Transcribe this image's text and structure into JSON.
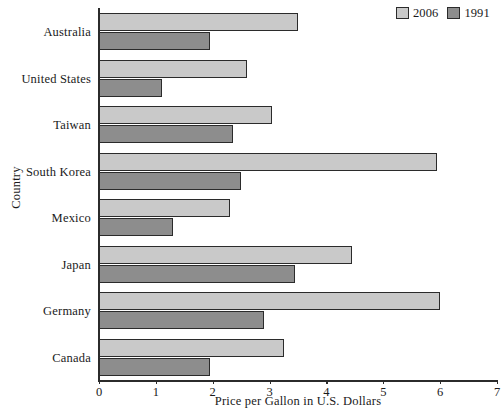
{
  "chart_data": {
    "type": "bar",
    "orientation": "horizontal",
    "title": "",
    "xlabel": "Price per Gallon in U.S. Dollars",
    "ylabel": "Country",
    "xlim": [
      0,
      7
    ],
    "xticks": [
      "0",
      "1",
      "2",
      "3",
      "4",
      "5",
      "6",
      "7"
    ],
    "grid": false,
    "legend_position": "top-right",
    "categories": [
      "Australia",
      "United States",
      "Taiwan",
      "South Korea",
      "Mexico",
      "Japan",
      "Germany",
      "Canada"
    ],
    "series": [
      {
        "name": "2006",
        "color": "#c9c9c9",
        "values": [
          3.5,
          2.6,
          3.05,
          5.95,
          2.3,
          4.45,
          6.0,
          3.25
        ]
      },
      {
        "name": "1991",
        "color": "#8d8d8d",
        "values": [
          1.95,
          1.1,
          2.35,
          2.5,
          1.3,
          3.45,
          2.9,
          1.95
        ]
      }
    ]
  },
  "legend": {
    "entries": [
      {
        "label": "2006",
        "swatch": "#c9c9c9"
      },
      {
        "label": "1991",
        "swatch": "#8d8d8d"
      }
    ]
  },
  "axes": {
    "x_title": "Price per Gallon in U.S. Dollars",
    "y_title": "Country"
  }
}
